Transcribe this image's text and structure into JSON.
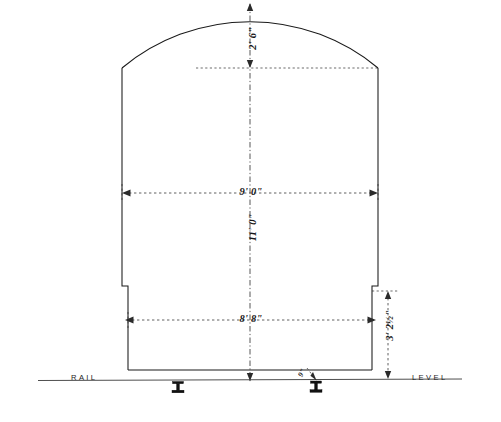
{
  "drawing": {
    "type": "engineering-cross-section",
    "subject": "railway tunnel clearance outline",
    "canvas": {
      "width": 501,
      "height": 422
    },
    "background_color": "#ffffff",
    "line_color": "#1a1a1a"
  },
  "baseline": {
    "left_label": "RAIL",
    "right_label": "LEVEL"
  },
  "dimensions": {
    "arch_rise": {
      "feet": "2'",
      "inches": "6\"",
      "text": "2' 6\"",
      "orientation": "vertical"
    },
    "upper_width": {
      "feet": "9'",
      "inches": "0\"",
      "text": "9' 0\"",
      "orientation": "horizontal"
    },
    "total_height": {
      "feet": "11'",
      "inches": "0\"",
      "text": "11' 0\"",
      "orientation": "vertical"
    },
    "lower_width": {
      "feet": "8'",
      "inches": "8\"",
      "text": "8' 8\"",
      "orientation": "horizontal"
    },
    "side_height": {
      "feet": "3'",
      "inches": "2",
      "fraction": "1/2",
      "inch_mark": "\"",
      "text": "3' 2½\"",
      "orientation": "vertical"
    },
    "rail_offset": {
      "text": "9\"",
      "orientation": "oblique"
    }
  },
  "geometry": {
    "center_x": 250,
    "crown_y": 4,
    "springing_y": 68,
    "wall_left_x": 122,
    "wall_right_x": 378,
    "notch_y": 286,
    "notch_left_x": 128,
    "notch_right_x": 372,
    "floor_y": 370,
    "rail_level_y": 380
  },
  "rails": [
    {
      "name": "left-rail",
      "x": 178,
      "y": 384
    },
    {
      "name": "right-rail",
      "x": 316,
      "y": 384
    }
  ]
}
